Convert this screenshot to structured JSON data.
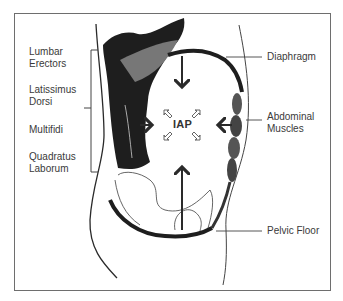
{
  "diagram": {
    "center_label": "IAP",
    "left_labels": [
      {
        "id": "lumbar-erectors",
        "line1": "Lumbar",
        "line2": "Erectors"
      },
      {
        "id": "latissimus-dorsi",
        "line1": "Latissimus",
        "line2": "Dorsi"
      },
      {
        "id": "multifidi",
        "line1": "Multifidi",
        "line2": ""
      },
      {
        "id": "quadratus-laborum",
        "line1": "Quadratus",
        "line2": "Laborum"
      }
    ],
    "right_labels": [
      {
        "id": "diaphragm",
        "text": "Diaphragm"
      },
      {
        "id": "abdominal-muscles",
        "line1": "Abdominal",
        "line2": "Muscles"
      },
      {
        "id": "pelvic-floor",
        "text": "Pelvic Floor"
      }
    ],
    "colors": {
      "line": "#2a2a2a",
      "frame": "#6e6e6e",
      "text": "#3a3a3a"
    }
  }
}
